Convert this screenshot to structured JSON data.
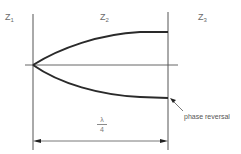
{
  "diagram": {
    "regions": [
      {
        "id": "z1",
        "symbol": "Z",
        "subscript": "1"
      },
      {
        "id": "z2",
        "symbol": "Z",
        "subscript": "2"
      },
      {
        "id": "z3",
        "symbol": "Z",
        "subscript": "3"
      }
    ],
    "dimension": {
      "numerator": "λ",
      "denominator": "4"
    },
    "annotation": "phase reversal",
    "colors": {
      "line": "#3a3a3a",
      "thick_curve": "#2a2a2a",
      "text": "#6a6a6a"
    }
  }
}
